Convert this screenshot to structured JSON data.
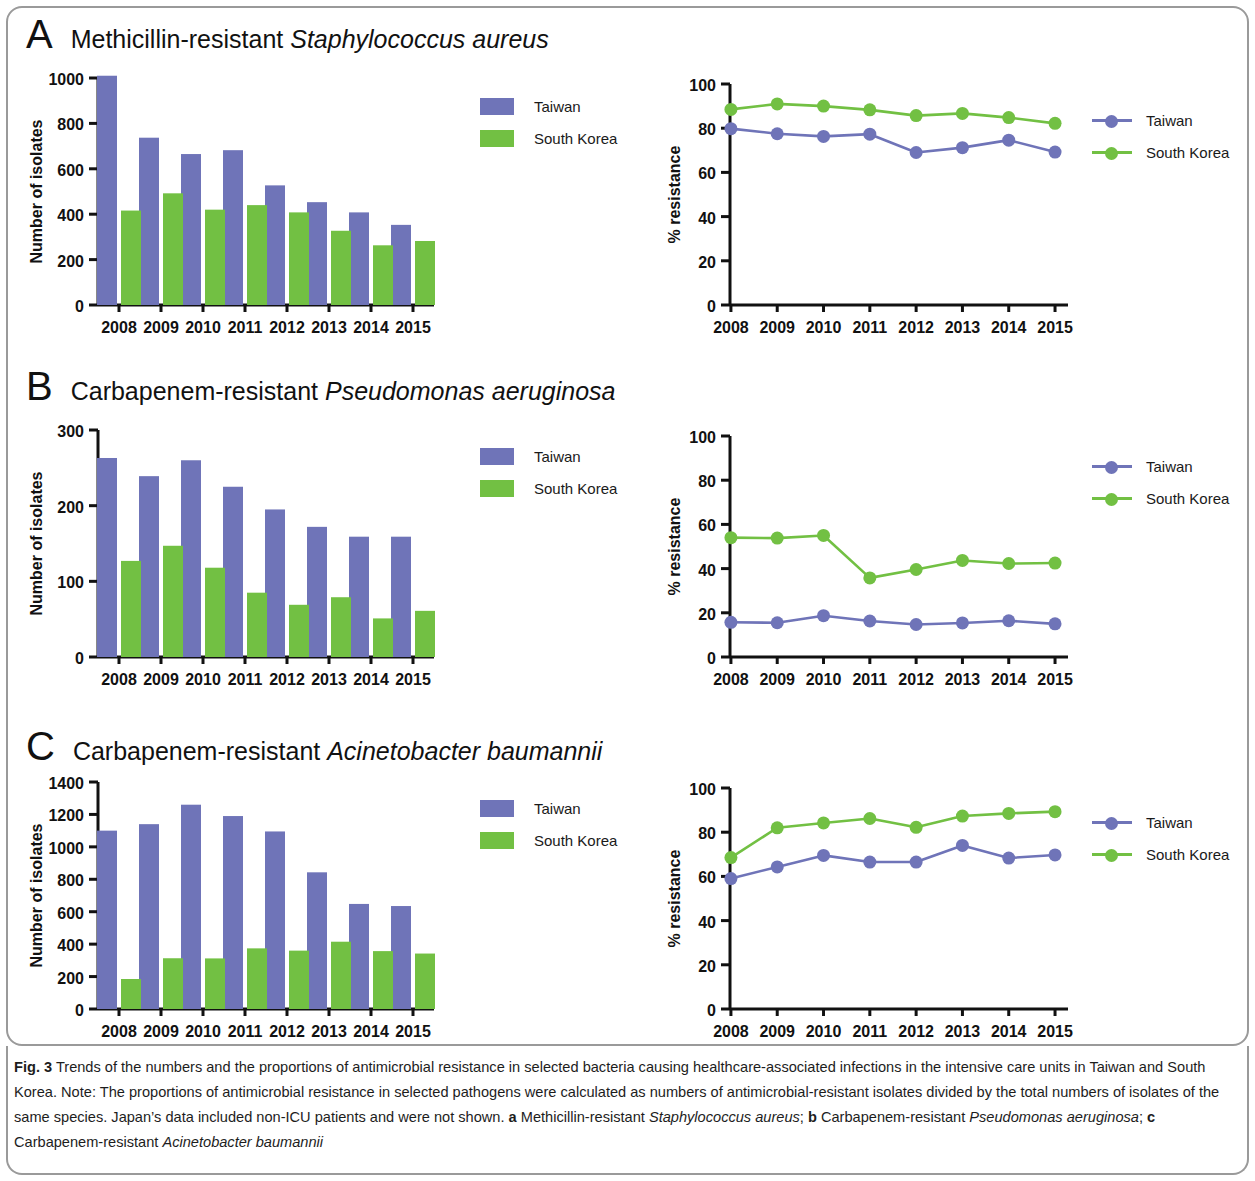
{
  "figure": {
    "caption_label": "Fig. 3",
    "caption_body": " Trends of the numbers and the proportions of antimicrobial resistance in selected bacteria causing healthcare-associated infections in the intensive care units in Taiwan and South Korea. Note: The proportions of antimicrobial resistance in selected pathogens were calculated as numbers of antimicrobial-resistant isolates divided by the total numbers of isolates of the same species. Japan’s data included non-ICU patients and were not shown. ",
    "caption_a_label": "a",
    "caption_a_text": " Methicillin-resistant ",
    "caption_a_italic": "Staphylococcus aureus",
    "caption_a_sep": "; ",
    "caption_b_label": "b",
    "caption_b_text": " Carbapenem-resistant ",
    "caption_b_italic": "Pseudomonas aeruginosa",
    "caption_b_sep": "; ",
    "caption_c_label": "c",
    "caption_c_text": " Carbapenem-resistant ",
    "caption_c_italic": "Acinetobacter baumannii"
  },
  "colors": {
    "taiwan": "#6f74b8",
    "south_korea": "#72c043",
    "axis": "#111111",
    "frame": "#9a9a9a"
  },
  "panels": [
    {
      "letter": "A",
      "title_plain": "Methicillin-resistant ",
      "title_italic": "Staphylococcus aureus"
    },
    {
      "letter": "B",
      "title_plain": "Carbapenem-resistant ",
      "title_italic": "Pseudomonas aeruginosa"
    },
    {
      "letter": "C",
      "title_plain": "Carbapenem-resistant ",
      "title_italic": "Acinetobacter baumannii"
    }
  ],
  "legend": {
    "taiwan": "Taiwan",
    "south_korea": "South Korea"
  },
  "chart_data": [
    {
      "id": "a-counts",
      "panel": "A",
      "type": "bar",
      "title": "Methicillin-resistant Staphylococcus aureus",
      "xlabel": "",
      "ylabel": "Number of isolates",
      "categories": [
        "2008",
        "2009",
        "2010",
        "2011",
        "2012",
        "2013",
        "2014",
        "2015"
      ],
      "ylim": [
        0,
        1000
      ],
      "yticks": [
        0,
        200,
        400,
        600,
        800,
        1000
      ],
      "grid": false,
      "legend_position": "right",
      "series": [
        {
          "name": "Taiwan",
          "color": "#6f74b8",
          "values": [
            1010,
            737,
            665,
            682,
            527,
            453,
            408,
            353
          ]
        },
        {
          "name": "South Korea",
          "color": "#72c043",
          "values": [
            416,
            492,
            420,
            440,
            408,
            327,
            263,
            282
          ]
        }
      ]
    },
    {
      "id": "a-resistance",
      "panel": "A",
      "type": "line",
      "title": "",
      "xlabel": "",
      "ylabel": "% resistance",
      "categories": [
        "2008",
        "2009",
        "2010",
        "2011",
        "2012",
        "2013",
        "2014",
        "2015"
      ],
      "ylim": [
        0,
        100
      ],
      "yticks": [
        0,
        20,
        40,
        60,
        80,
        100
      ],
      "grid": false,
      "legend_position": "right",
      "series": [
        {
          "name": "Taiwan",
          "color": "#6f74b8",
          "values": [
            79.8,
            77.5,
            76.3,
            77.3,
            69.0,
            71.2,
            74.6,
            69.2
          ]
        },
        {
          "name": "South Korea",
          "color": "#72c043",
          "values": [
            88.5,
            91.0,
            90.0,
            88.3,
            85.7,
            86.7,
            84.8,
            82.2
          ]
        }
      ]
    },
    {
      "id": "b-counts",
      "panel": "B",
      "type": "bar",
      "title": "Carbapenem-resistant Pseudomonas aeruginosa",
      "xlabel": "",
      "ylabel": "Number of isolates",
      "categories": [
        "2008",
        "2009",
        "2010",
        "2011",
        "2012",
        "2013",
        "2014",
        "2015"
      ],
      "ylim": [
        0,
        300
      ],
      "yticks": [
        0,
        100,
        200,
        300
      ],
      "grid": false,
      "legend_position": "right",
      "series": [
        {
          "name": "Taiwan",
          "color": "#6f74b8",
          "values": [
            263,
            239,
            260,
            225,
            195,
            172,
            159,
            159
          ]
        },
        {
          "name": "South Korea",
          "color": "#72c043",
          "values": [
            127,
            147,
            118,
            85,
            69,
            79,
            51,
            61
          ]
        }
      ]
    },
    {
      "id": "b-resistance",
      "panel": "B",
      "type": "line",
      "title": "",
      "xlabel": "",
      "ylabel": "% resistance",
      "categories": [
        "2008",
        "2009",
        "2010",
        "2011",
        "2012",
        "2013",
        "2014",
        "2015"
      ],
      "ylim": [
        0,
        100
      ],
      "yticks": [
        0,
        20,
        40,
        60,
        80,
        100
      ],
      "grid": false,
      "legend_position": "right",
      "series": [
        {
          "name": "Taiwan",
          "color": "#6f74b8",
          "values": [
            15.7,
            15.5,
            18.7,
            16.3,
            14.7,
            15.4,
            16.4,
            15.0
          ]
        },
        {
          "name": "South Korea",
          "color": "#72c043",
          "values": [
            54.0,
            53.8,
            55.0,
            35.8,
            39.6,
            43.7,
            42.3,
            42.5
          ]
        }
      ]
    },
    {
      "id": "c-counts",
      "panel": "C",
      "type": "bar",
      "title": "Carbapenem-resistant Acinetobacter baumannii",
      "xlabel": "",
      "ylabel": "Number of isolates",
      "categories": [
        "2008",
        "2009",
        "2010",
        "2011",
        "2012",
        "2013",
        "2014",
        "2015"
      ],
      "ylim": [
        0,
        1400
      ],
      "yticks": [
        0,
        200,
        400,
        600,
        800,
        1000,
        1200,
        1400
      ],
      "grid": false,
      "legend_position": "right",
      "series": [
        {
          "name": "Taiwan",
          "color": "#6f74b8",
          "values": [
            1100,
            1140,
            1260,
            1190,
            1095,
            843,
            648,
            635
          ]
        },
        {
          "name": "South Korea",
          "color": "#72c043",
          "values": [
            185,
            313,
            312,
            374,
            360,
            415,
            357,
            342
          ]
        }
      ]
    },
    {
      "id": "c-resistance",
      "panel": "C",
      "type": "line",
      "title": "",
      "xlabel": "",
      "ylabel": "% resistance",
      "categories": [
        "2008",
        "2009",
        "2010",
        "2011",
        "2012",
        "2013",
        "2014",
        "2015"
      ],
      "ylim": [
        0,
        100
      ],
      "yticks": [
        0,
        20,
        40,
        60,
        80,
        100
      ],
      "grid": false,
      "legend_position": "right",
      "series": [
        {
          "name": "Taiwan",
          "color": "#6f74b8",
          "values": [
            59.0,
            64.3,
            69.5,
            66.5,
            66.5,
            74.0,
            68.3,
            69.7
          ]
        },
        {
          "name": "South Korea",
          "color": "#72c043",
          "values": [
            68.5,
            82.0,
            84.2,
            86.2,
            82.2,
            87.3,
            88.5,
            89.3
          ]
        }
      ]
    }
  ]
}
